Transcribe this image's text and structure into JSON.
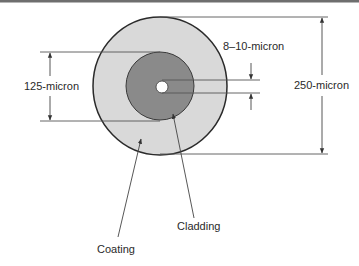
{
  "diagram": {
    "colors": {
      "border": "#6e6e6e",
      "coating_fill": "#d9d9d9",
      "cladding_fill": "#8a8a8a",
      "core_fill": "#ffffff",
      "outline": "#2a2a2a",
      "dim_line": "#555555",
      "text": "#2a2a2a"
    },
    "layers": [
      {
        "name": "Coating",
        "diameter_label": "250-micron"
      },
      {
        "name": "Cladding",
        "diameter_label": "125-micron"
      },
      {
        "name": "Core",
        "diameter_label": "8–10-micron"
      }
    ],
    "dimensions": {
      "coating": "250-micron",
      "cladding": "125-micron",
      "core": "8–10-micron"
    },
    "callouts": {
      "coating": "Coating",
      "cladding": "Cladding"
    }
  }
}
